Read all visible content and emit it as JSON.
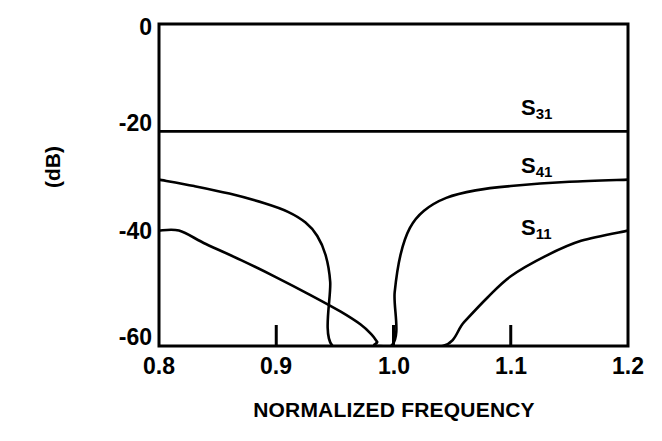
{
  "chart_data": {
    "type": "line",
    "title": "",
    "xlabel": "NORMALIZED FREQUENCY",
    "ylabel": "(dB)",
    "xlim": [
      0.8,
      1.2
    ],
    "ylim": [
      -60,
      0
    ],
    "grid": false,
    "legend_position": "inline-right",
    "x_ticks": [
      {
        "value": 0.8,
        "label": "0.8",
        "mark": false
      },
      {
        "value": 0.9,
        "label": "0.9",
        "mark": true
      },
      {
        "value": 1.0,
        "label": "1.0",
        "mark": true
      },
      {
        "value": 1.1,
        "label": "1.1",
        "mark": true
      },
      {
        "value": 1.2,
        "label": "1.2",
        "mark": false
      }
    ],
    "y_ticks": [
      {
        "value": 0,
        "label": "0"
      },
      {
        "value": -20,
        "label": "-20"
      },
      {
        "value": -40,
        "label": "-40"
      },
      {
        "value": -60,
        "label": "-60"
      }
    ],
    "series": [
      {
        "name": "S31",
        "label_text": "S",
        "label_sub": "31",
        "points": [
          [
            0.8,
            -20.0
          ],
          [
            0.9,
            -20.0
          ],
          [
            1.0,
            -20.0
          ],
          [
            1.1,
            -20.0
          ],
          [
            1.2,
            -20.0
          ]
        ]
      },
      {
        "name": "S41",
        "label_text": "S",
        "label_sub": "41",
        "points": [
          [
            0.8,
            -29.0
          ],
          [
            0.83,
            -30.2
          ],
          [
            0.86,
            -31.6
          ],
          [
            0.89,
            -33.4
          ],
          [
            0.91,
            -35.0
          ],
          [
            0.925,
            -37.0
          ],
          [
            0.935,
            -39.5
          ],
          [
            0.942,
            -43.0
          ],
          [
            0.946,
            -48.0
          ],
          [
            0.948,
            -60.0
          ],
          [
            0.998,
            -60.0
          ],
          [
            1.001,
            -50.0
          ],
          [
            1.006,
            -43.0
          ],
          [
            1.014,
            -38.0
          ],
          [
            1.026,
            -34.8
          ],
          [
            1.045,
            -32.4
          ],
          [
            1.07,
            -31.0
          ],
          [
            1.1,
            -30.2
          ],
          [
            1.15,
            -29.4
          ],
          [
            1.2,
            -29.0
          ]
        ]
      },
      {
        "name": "S11",
        "label_text": "S",
        "label_sub": "11",
        "points": [
          [
            0.8,
            -38.5
          ],
          [
            0.817,
            -38.5
          ],
          [
            0.84,
            -41.0
          ],
          [
            0.87,
            -44.0
          ],
          [
            0.9,
            -47.2
          ],
          [
            0.93,
            -50.6
          ],
          [
            0.955,
            -53.6
          ],
          [
            0.972,
            -56.0
          ],
          [
            0.981,
            -57.8
          ],
          [
            0.986,
            -59.2
          ],
          [
            0.988,
            -60.0
          ],
          [
            1.042,
            -60.0
          ],
          [
            1.06,
            -55.6
          ],
          [
            1.08,
            -51.0
          ],
          [
            1.1,
            -47.0
          ],
          [
            1.13,
            -43.2
          ],
          [
            1.16,
            -40.4
          ],
          [
            1.2,
            -38.5
          ]
        ]
      }
    ]
  },
  "axis": {
    "y_label": "(dB)",
    "x_label": "NORMALIZED FREQUENCY"
  },
  "labels": {
    "s31": {
      "base": "S",
      "sub": "31"
    },
    "s41": {
      "base": "S",
      "sub": "41"
    },
    "s11": {
      "base": "S",
      "sub": "11"
    }
  },
  "style": {
    "line_color": "#000000",
    "background": "#ffffff",
    "axis_color": "#000000"
  }
}
